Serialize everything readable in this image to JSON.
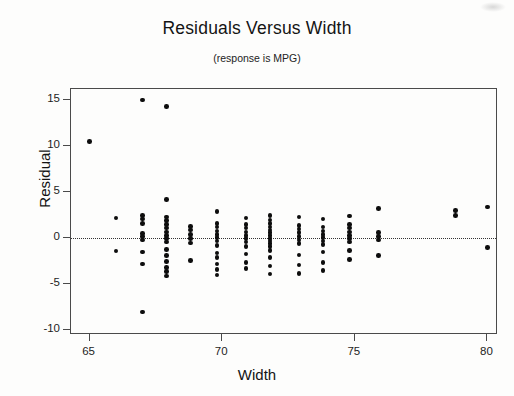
{
  "chart_data": {
    "type": "scatter",
    "title": "Residuals Versus Width",
    "subtitle": "(response is MPG)",
    "xlabel": "Width",
    "ylabel": "Residual",
    "xlim": [
      64.3,
      80.4
    ],
    "ylim": [
      -10.5,
      16.2
    ],
    "xticks": [
      65,
      70,
      75,
      80
    ],
    "xtick_labels": [
      "65",
      "70",
      "75",
      "80"
    ],
    "yticks": [
      15,
      10,
      5,
      0,
      -5,
      -10
    ],
    "ytick_labels": [
      "15",
      "10",
      "5",
      "0",
      "-5",
      "-10"
    ],
    "grid": false,
    "legend": false,
    "reference_line": {
      "orientation": "horizontal",
      "y": 0,
      "style": "dotted"
    },
    "marker": {
      "shape": "circle",
      "color": "#0d0d0d",
      "size": 4.6
    },
    "points": [
      [
        65.0,
        10.5
      ],
      [
        66.0,
        2.2
      ],
      [
        66.0,
        -1.4
      ],
      [
        67.0,
        15.0
      ],
      [
        67.0,
        2.5
      ],
      [
        67.0,
        2.1
      ],
      [
        67.0,
        1.6
      ],
      [
        67.0,
        0.5
      ],
      [
        67.0,
        0.2
      ],
      [
        67.0,
        -0.2
      ],
      [
        67.0,
        -1.5
      ],
      [
        67.0,
        -2.8
      ],
      [
        67.0,
        -8.0
      ],
      [
        67.9,
        14.3
      ],
      [
        67.9,
        4.2
      ],
      [
        67.9,
        2.3
      ],
      [
        67.9,
        1.9
      ],
      [
        67.9,
        1.5
      ],
      [
        67.9,
        1.1
      ],
      [
        67.9,
        0.7
      ],
      [
        67.9,
        0.3
      ],
      [
        67.9,
        0.0
      ],
      [
        67.9,
        -0.4
      ],
      [
        67.9,
        -1.2
      ],
      [
        67.9,
        -1.9
      ],
      [
        67.9,
        -2.5
      ],
      [
        67.9,
        -3.2
      ],
      [
        67.9,
        -3.6
      ],
      [
        67.9,
        -4.1
      ],
      [
        68.8,
        1.3
      ],
      [
        68.8,
        0.9
      ],
      [
        68.8,
        0.4
      ],
      [
        68.8,
        0.0
      ],
      [
        68.8,
        -0.5
      ],
      [
        68.8,
        -2.4
      ],
      [
        69.8,
        2.9
      ],
      [
        69.8,
        1.6
      ],
      [
        69.8,
        1.2
      ],
      [
        69.8,
        0.8
      ],
      [
        69.8,
        0.4
      ],
      [
        69.8,
        0.1
      ],
      [
        69.8,
        -0.3
      ],
      [
        69.8,
        -0.8
      ],
      [
        69.8,
        -1.6
      ],
      [
        69.8,
        -2.1
      ],
      [
        69.8,
        -2.8
      ],
      [
        69.8,
        -3.4
      ],
      [
        69.8,
        -4.0
      ],
      [
        70.9,
        2.2
      ],
      [
        70.9,
        1.5
      ],
      [
        70.9,
        1.1
      ],
      [
        70.9,
        0.7
      ],
      [
        70.9,
        0.3
      ],
      [
        70.9,
        0.0
      ],
      [
        70.9,
        -0.4
      ],
      [
        70.9,
        -0.9
      ],
      [
        70.9,
        -1.7
      ],
      [
        70.9,
        -2.6
      ],
      [
        70.9,
        -3.3
      ],
      [
        71.8,
        2.5
      ],
      [
        71.8,
        2.0
      ],
      [
        71.8,
        1.6
      ],
      [
        71.8,
        1.2
      ],
      [
        71.8,
        0.9
      ],
      [
        71.8,
        0.6
      ],
      [
        71.8,
        0.3
      ],
      [
        71.8,
        0.0
      ],
      [
        71.8,
        -0.3
      ],
      [
        71.8,
        -0.6
      ],
      [
        71.8,
        -0.9
      ],
      [
        71.8,
        -1.3
      ],
      [
        71.8,
        -2.1
      ],
      [
        71.8,
        -3.0
      ],
      [
        71.8,
        -3.9
      ],
      [
        72.9,
        2.3
      ],
      [
        72.9,
        1.4
      ],
      [
        72.9,
        1.0
      ],
      [
        72.9,
        0.6
      ],
      [
        72.9,
        0.2
      ],
      [
        72.9,
        -0.2
      ],
      [
        72.9,
        -0.6
      ],
      [
        72.9,
        -1.8
      ],
      [
        72.9,
        -2.9
      ],
      [
        72.9,
        -3.8
      ],
      [
        73.8,
        2.1
      ],
      [
        73.8,
        1.2
      ],
      [
        73.8,
        0.8
      ],
      [
        73.8,
        0.4
      ],
      [
        73.8,
        0.1
      ],
      [
        73.8,
        -0.3
      ],
      [
        73.8,
        -0.7
      ],
      [
        73.8,
        -1.5
      ],
      [
        73.8,
        -2.6
      ],
      [
        73.8,
        -3.5
      ],
      [
        74.8,
        2.4
      ],
      [
        74.8,
        1.5
      ],
      [
        74.8,
        1.1
      ],
      [
        74.8,
        0.7
      ],
      [
        74.8,
        0.3
      ],
      [
        74.8,
        0.0
      ],
      [
        74.8,
        -0.4
      ],
      [
        74.8,
        -1.3
      ],
      [
        74.8,
        -2.3
      ],
      [
        75.9,
        3.2
      ],
      [
        75.9,
        0.6
      ],
      [
        75.9,
        0.2
      ],
      [
        75.9,
        -0.2
      ],
      [
        75.9,
        -1.9
      ],
      [
        78.8,
        3.0
      ],
      [
        78.8,
        2.5
      ],
      [
        80.0,
        3.4
      ],
      [
        80.0,
        -1.0
      ]
    ]
  }
}
